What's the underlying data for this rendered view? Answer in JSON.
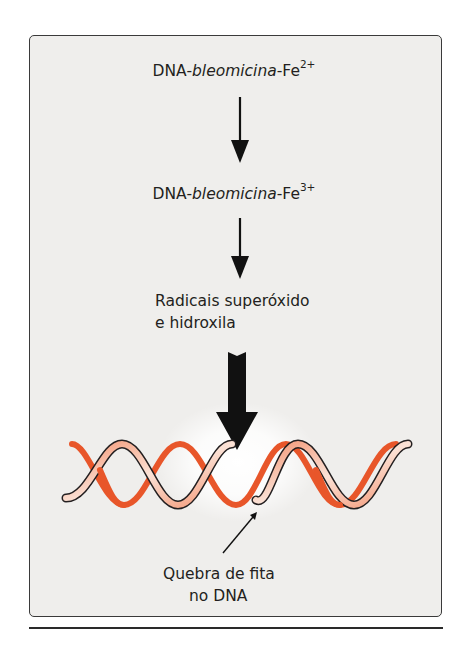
{
  "diagram": {
    "steps": [
      {
        "prefix": "DNA-",
        "italic": "bleomicina",
        "suffix": "-Fe",
        "superscript": "2+"
      },
      {
        "prefix": "DNA-",
        "italic": "bleomicina",
        "suffix": "-Fe",
        "superscript": "3+"
      },
      {
        "line1": "Radicais superóxido",
        "line2": "e hidroxila"
      }
    ],
    "result_label": {
      "line1": "Quebra de fita",
      "line2": "no DNA"
    },
    "arrows": [
      "thin-arrow",
      "thin-arrow",
      "thick-arrow",
      "pointer-arrow"
    ],
    "colors": {
      "panel_bg": "#efeeec",
      "border": "#3a3a3a",
      "dna_orange": "#e8562a",
      "dna_light": "#f7c4ae",
      "dna_dark": "#231f20",
      "text": "#231f20"
    }
  }
}
